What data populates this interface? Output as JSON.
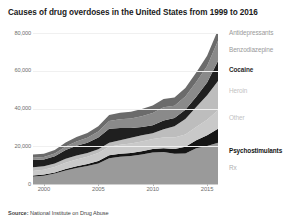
{
  "title": "Causes of drug overdoses in the United States from 1999 to 2016",
  "source": {
    "prefix": "Source:",
    "text": "National Institute on Drug Abuse",
    "full": "Source: National Institute on Drug Abuse"
  },
  "axes": {
    "y_ticks": [
      "0",
      "20,000",
      "40,000",
      "60,000",
      "80,000"
    ],
    "x_ticks": [
      "2000",
      "2005",
      "2010",
      "2015"
    ]
  },
  "legend": [
    {
      "label": "Antidepressants",
      "color": "#6b6b6b"
    },
    {
      "label": "Benzodiazepine",
      "color": "#8a8a8a"
    },
    {
      "label": "Cocaine",
      "color": "#1f1f1f"
    },
    {
      "label": "Heroin",
      "color": "#bdbdbd"
    },
    {
      "label": "Other",
      "color": "#c9c9c9"
    },
    {
      "label": "Psychostimulants",
      "color": "#151515"
    },
    {
      "label": "Rx",
      "color": "#9a9a9a"
    }
  ],
  "chart_data": {
    "type": "area",
    "title": "Causes of drug overdoses in the United States from 1999 to 2016",
    "xlabel": "",
    "ylabel": "",
    "stacked": true,
    "grid": true,
    "legend_position": "right-inline",
    "xlim": [
      1999,
      2016
    ],
    "ylim": [
      0,
      80000
    ],
    "x": [
      1999,
      2000,
      2001,
      2002,
      2003,
      2004,
      2005,
      2006,
      2007,
      2008,
      2009,
      2010,
      2011,
      2012,
      2013,
      2014,
      2015,
      2016
    ],
    "series": [
      {
        "name": "Rx",
        "color": "#9a9a9a",
        "values": [
          4000,
          4400,
          5500,
          7200,
          8500,
          9600,
          10900,
          13700,
          14400,
          14800,
          15600,
          16650,
          16900,
          16000,
          16200,
          18900,
          20100,
          21800
        ]
      },
      {
        "name": "Psychostimulants",
        "color": "#151515",
        "values": [
          550,
          600,
          650,
          800,
          900,
          1000,
          1300,
          1500,
          1600,
          1650,
          1750,
          1850,
          2000,
          2600,
          3600,
          4300,
          5700,
          7500
        ]
      },
      {
        "name": "Other",
        "color": "#c9c9c9",
        "values": [
          2400,
          2600,
          2900,
          3300,
          3600,
          3900,
          4200,
          4500,
          4800,
          5000,
          5200,
          5400,
          5700,
          6000,
          6400,
          7000,
          8200,
          9800
        ]
      },
      {
        "name": "Heroin",
        "color": "#bdbdbd",
        "values": [
          1960,
          1840,
          1780,
          2090,
          2080,
          1880,
          2010,
          2090,
          2400,
          3040,
          3280,
          3040,
          4400,
          5930,
          8260,
          10570,
          12990,
          15470
        ]
      },
      {
        "name": "Cocaine",
        "color": "#1f1f1f",
        "values": [
          3820,
          3540,
          3830,
          4600,
          5200,
          5450,
          6210,
          7450,
          6510,
          5130,
          4350,
          4180,
          4680,
          4400,
          4940,
          5420,
          6780,
          10620
        ]
      },
      {
        "name": "Benzodiazepine",
        "color": "#8a8a8a",
        "values": [
          1130,
          1300,
          1500,
          1900,
          2300,
          2700,
          3200,
          4100,
          4600,
          5100,
          5700,
          6500,
          7000,
          6500,
          6900,
          7900,
          8800,
          10680
        ]
      },
      {
        "name": "Antidepressants",
        "color": "#6b6b6b",
        "values": [
          1750,
          1800,
          1900,
          2100,
          2300,
          2500,
          2800,
          3200,
          3400,
          3600,
          3800,
          4000,
          4300,
          4400,
          4600,
          5000,
          5400,
          5800
        ]
      }
    ]
  }
}
